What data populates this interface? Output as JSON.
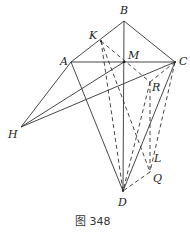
{
  "figure": {
    "caption": "图 348",
    "points": {
      "A": {
        "label": "A",
        "x": 71,
        "y": 62
      },
      "B": {
        "label": "B",
        "x": 124,
        "y": 21
      },
      "C": {
        "label": "C",
        "x": 175,
        "y": 62
      },
      "M": {
        "label": "M",
        "x": 124,
        "y": 62
      },
      "K": {
        "label": "K",
        "x": 101,
        "y": 41
      },
      "R": {
        "label": "R",
        "x": 150,
        "y": 82
      },
      "H": {
        "label": "H",
        "x": 21,
        "y": 127
      },
      "L": {
        "label": "L",
        "x": 153,
        "y": 153
      },
      "Q": {
        "label": "Q",
        "x": 150,
        "y": 172
      },
      "D": {
        "label": "D",
        "x": 123,
        "y": 191
      }
    }
  }
}
